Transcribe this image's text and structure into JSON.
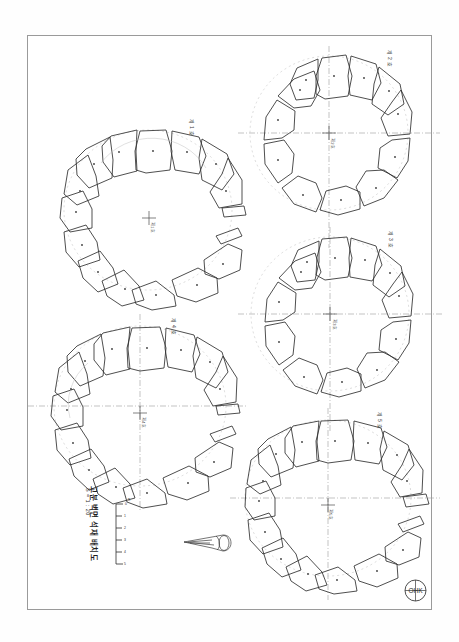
{
  "document": {
    "kind": "archaeological-plan-drawing",
    "sheet_background": "#fefefe",
    "ink_color": "#2b2b2b",
    "light_ink_color": "#8d8d8d",
    "border_color": "#9a9a9a"
  },
  "title_block": {
    "title": "고분 벽면 석재 배치도",
    "subtitle": "S = 1 : 20",
    "rotation_degrees": 90
  },
  "scale_bar": {
    "label": "m",
    "ticks": [
      "0",
      "1",
      "2",
      "3",
      "4",
      "5"
    ],
    "orientation": "vertical",
    "divisions": 5
  },
  "stamp": {
    "name": "registration-stamp",
    "letters": "OHK",
    "shape": "circle-with-cross"
  },
  "artifact": {
    "name": "pointed-artifact",
    "caption": ""
  },
  "figures": [
    {
      "id": "fig-top-left",
      "label": "제 1 호",
      "label_rotation": 90,
      "stone_count": 13,
      "center_mark": "cross",
      "center_caption": "제1호",
      "axis_lines": [
        "vertical-dashed"
      ],
      "has_detached_block": true,
      "detached_block_count": 2,
      "gap_position": "east",
      "cx": 148,
      "cy": 210,
      "rx": 82,
      "ry": 78
    },
    {
      "id": "fig-top-right",
      "label": "제 2 호",
      "label_rotation": 90,
      "stone_count": 12,
      "center_mark": "cross",
      "center_caption": "제2호",
      "axis_lines": [
        "horizontal-dashdot",
        "vertical-dashdot"
      ],
      "has_detached_block": false,
      "detached_block_count": 0,
      "gap_position": "none",
      "cx": 328,
      "cy": 130,
      "rx": 78,
      "ry": 76
    },
    {
      "id": "fig-mid-right",
      "label": "제 3 호",
      "label_rotation": 90,
      "stone_count": 12,
      "center_mark": "cross",
      "center_caption": "제3호",
      "axis_lines": [
        "horizontal-dashdot",
        "vertical-dashdot"
      ],
      "has_detached_block": false,
      "detached_block_count": 0,
      "gap_position": "none",
      "cx": 330,
      "cy": 313,
      "rx": 78,
      "ry": 76
    },
    {
      "id": "fig-bot-left",
      "label": "제 4 호",
      "label_rotation": 90,
      "stone_count": 13,
      "center_mark": "cross",
      "center_caption": "제4호",
      "axis_lines": [
        "horizontal-dashdot",
        "vertical-dashdot"
      ],
      "has_detached_block": true,
      "detached_block_count": 2,
      "gap_position": "east",
      "cx": 140,
      "cy": 404,
      "rx": 84,
      "ry": 79
    },
    {
      "id": "fig-bot-right",
      "label": "제 5 호",
      "label_rotation": 90,
      "stone_count": 13,
      "center_mark": "cross",
      "center_caption": "제5호",
      "axis_lines": [
        "horizontal-dashdot",
        "vertical-dashdot"
      ],
      "has_detached_block": true,
      "detached_block_count": 2,
      "gap_position": "east",
      "cx": 326,
      "cy": 497,
      "rx": 82,
      "ry": 78
    }
  ]
}
